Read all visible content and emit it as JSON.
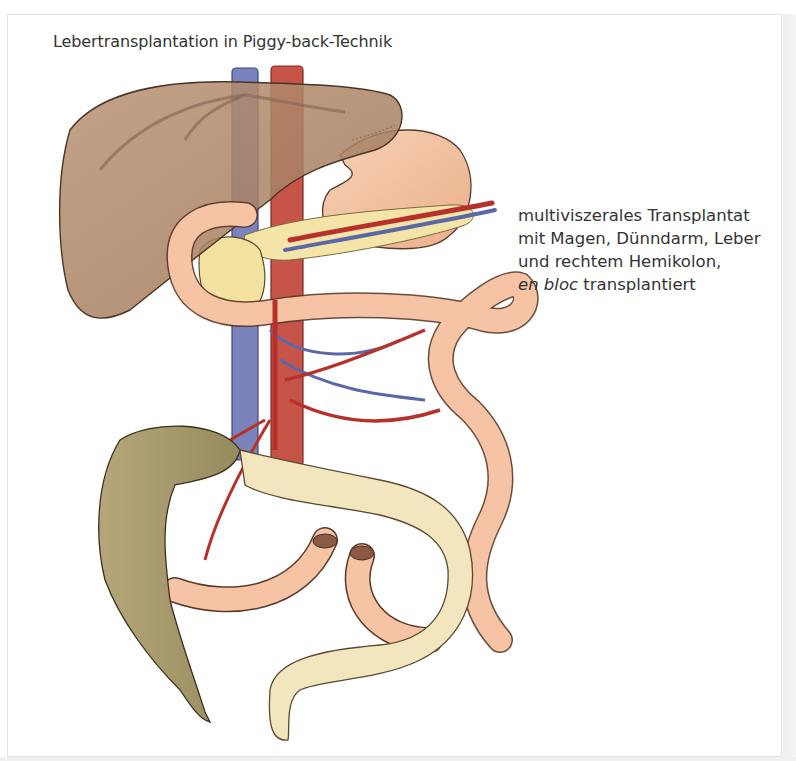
{
  "figure": {
    "title": "Lebertransplantation in Piggy-back-Technik",
    "caption": {
      "line1": "multiviszerales Transplantat",
      "line2": "mit Magen, Dünndarm, Leber",
      "line3": "und rechtem Hemikolon,",
      "line4_italic": "en bloc",
      "line4_rest": " transplantiert"
    }
  },
  "illustration": {
    "structures": [
      {
        "name": "liver",
        "color": "#a9825f"
      },
      {
        "name": "inferior-vena-cava",
        "color": "#6f79b4"
      },
      {
        "name": "aorta",
        "color": "#c1483e"
      },
      {
        "name": "stomach",
        "color": "#f2c1a0"
      },
      {
        "name": "pancreas",
        "color": "#f4e3a6"
      },
      {
        "name": "duodenum-small-intestine",
        "color": "#f6c4a4"
      },
      {
        "name": "native-colon",
        "color": "#a89a6c"
      },
      {
        "name": "transplanted-colon",
        "color": "#f3e6bf"
      },
      {
        "name": "mesenteric-arteries",
        "color": "#b8302a"
      },
      {
        "name": "mesenteric-veins",
        "color": "#5c67a8"
      }
    ]
  }
}
